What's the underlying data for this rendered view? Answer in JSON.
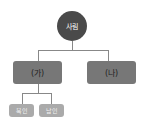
{
  "diagram": {
    "root": {
      "label": "사림",
      "color": "#4a4a4a"
    },
    "level1": [
      {
        "label": "(가)",
        "color": "#777777"
      },
      {
        "label": "(나)",
        "color": "#777777"
      }
    ],
    "level2": [
      {
        "label": "북인",
        "color": "#aaaaaa"
      },
      {
        "label": "남인",
        "color": "#aaaaaa"
      }
    ],
    "connector_color": "#888888"
  }
}
